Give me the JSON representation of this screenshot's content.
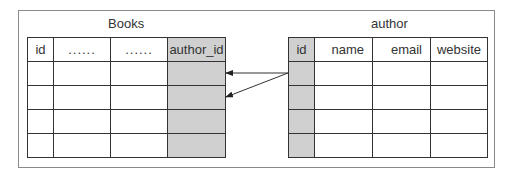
{
  "diagram": {
    "books": {
      "title": "Books",
      "headers": [
        "id",
        "......",
        "......",
        "author_id"
      ],
      "row_count": 4,
      "highlight_column": "author_id"
    },
    "author": {
      "title": "author",
      "headers": [
        "id",
        "name",
        "email",
        "website"
      ],
      "row_count": 4,
      "highlight_column": "id"
    },
    "relations": [
      {
        "from": "author.id",
        "to": "books.author_id",
        "to_row": 1
      },
      {
        "from": "author.id",
        "to": "books.author_id",
        "to_row": 2
      }
    ],
    "colors": {
      "highlight": "#d0d0d0",
      "line": "#333333",
      "frame": "#8a8a8a"
    }
  }
}
